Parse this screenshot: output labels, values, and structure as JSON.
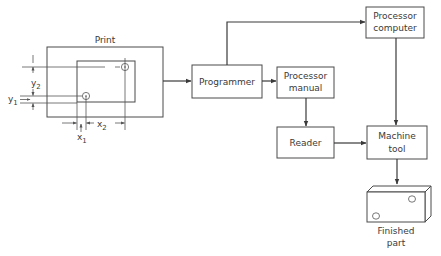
{
  "diagram": {
    "print": {
      "title": "Print",
      "dimensions": {
        "y2": "y",
        "y2_sub": "2",
        "y1": "y",
        "y1_sub": "1",
        "x1": "x",
        "x1_sub": "1",
        "x2": "x",
        "x2_sub": "2"
      }
    },
    "nodes": {
      "programmer": "Programmer",
      "processor_manual_line1": "Processor",
      "processor_manual_line2": "manual",
      "processor_computer_line1": "Processor",
      "processor_computer_line2": "computer",
      "reader": "Reader",
      "machine_tool_line1": "Machine",
      "machine_tool_line2": "tool",
      "finished_part_line1": "Finished",
      "finished_part_line2": "part"
    },
    "edges": [
      {
        "from": "Print",
        "to": "Programmer"
      },
      {
        "from": "Programmer",
        "to": "Processor manual"
      },
      {
        "from": "Programmer",
        "to": "Processor computer"
      },
      {
        "from": "Processor manual",
        "to": "Reader"
      },
      {
        "from": "Reader",
        "to": "Machine tool"
      },
      {
        "from": "Processor computer",
        "to": "Machine tool"
      },
      {
        "from": "Machine tool",
        "to": "Finished part"
      }
    ],
    "colors": {
      "line": "#3a3a3a",
      "background": "#ffffff"
    }
  }
}
